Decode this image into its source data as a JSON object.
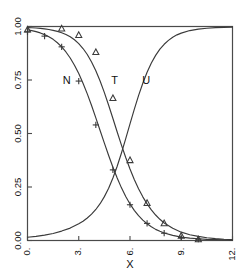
{
  "chart_data": {
    "type": "line",
    "title": "",
    "xlabel": "X",
    "ylabel": "",
    "xlim": [
      0,
      12
    ],
    "ylim": [
      0.0,
      1.0
    ],
    "grid": false,
    "legend": "inline-curve-labels",
    "xticks": [
      0,
      3,
      6,
      9,
      12
    ],
    "xtick_labels": [
      "0.",
      "3.",
      "6.",
      "9.",
      "12."
    ],
    "yticks": [
      0.0,
      0.25,
      0.5,
      0.75,
      1.0
    ],
    "ytick_labels": [
      "0.00",
      "0.25",
      "0.50",
      "0.75",
      "1.00"
    ],
    "series": [
      {
        "name": "N",
        "label": "N",
        "marker": "plus",
        "label_x": 2.3,
        "label_y": 0.745,
        "line": {
          "x": [
            0.0,
            0.25,
            0.5,
            0.75,
            1.0,
            1.25,
            1.5,
            1.75,
            2.0,
            2.25,
            2.5,
            2.75,
            3.0,
            3.25,
            3.5,
            3.75,
            4.0,
            4.25,
            4.5,
            4.75,
            5.0,
            5.25,
            5.5,
            5.75,
            6.0,
            6.25,
            6.5,
            6.75,
            7.0,
            7.25,
            7.5,
            7.75,
            8.0,
            8.5,
            9.0,
            9.5,
            10.0,
            10.5,
            11.0,
            11.5,
            12.0
          ],
          "y": [
            0.985,
            0.981,
            0.976,
            0.97,
            0.962,
            0.952,
            0.94,
            0.924,
            0.905,
            0.881,
            0.853,
            0.819,
            0.78,
            0.735,
            0.685,
            0.631,
            0.573,
            0.514,
            0.455,
            0.397,
            0.342,
            0.292,
            0.246,
            0.206,
            0.171,
            0.141,
            0.116,
            0.095,
            0.078,
            0.064,
            0.052,
            0.043,
            0.035,
            0.024,
            0.016,
            0.011,
            0.008,
            0.005,
            0.004,
            0.003,
            0.002
          ]
        },
        "points": {
          "x": [
            0.0,
            1.0,
            2.0,
            3.0,
            4.0,
            5.0,
            6.0,
            7.0,
            8.0,
            9.0,
            10.0
          ],
          "y": [
            0.975,
            0.955,
            0.905,
            0.745,
            0.54,
            0.33,
            0.167,
            0.08,
            0.034,
            0.014,
            0.006
          ]
        }
      },
      {
        "name": "T",
        "label": "T",
        "marker": "triangle",
        "label_x": 5.1,
        "label_y": 0.745,
        "line": {
          "x": [
            0.0,
            0.25,
            0.5,
            0.75,
            1.0,
            1.25,
            1.5,
            1.75,
            2.0,
            2.25,
            2.5,
            2.75,
            3.0,
            3.25,
            3.5,
            3.75,
            4.0,
            4.25,
            4.5,
            4.75,
            5.0,
            5.25,
            5.5,
            5.75,
            6.0,
            6.25,
            6.5,
            6.75,
            7.0,
            7.25,
            7.5,
            7.75,
            8.0,
            8.5,
            9.0,
            9.5,
            10.0,
            10.5,
            11.0,
            11.5,
            12.0
          ],
          "y": [
            0.995,
            0.994,
            0.993,
            0.991,
            0.989,
            0.986,
            0.982,
            0.977,
            0.971,
            0.963,
            0.952,
            0.938,
            0.92,
            0.897,
            0.869,
            0.834,
            0.793,
            0.745,
            0.691,
            0.632,
            0.57,
            0.507,
            0.446,
            0.388,
            0.334,
            0.285,
            0.242,
            0.204,
            0.171,
            0.143,
            0.119,
            0.099,
            0.082,
            0.057,
            0.039,
            0.027,
            0.019,
            0.013,
            0.009,
            0.006,
            0.004
          ]
        },
        "points": {
          "x": [
            0.0,
            2.0,
            3.0,
            4.0,
            5.0,
            6.0,
            7.0,
            8.0,
            9.0,
            10.0
          ],
          "y": [
            0.985,
            0.99,
            0.96,
            0.88,
            0.665,
            0.375,
            0.175,
            0.08,
            0.022,
            0.005
          ]
        }
      },
      {
        "name": "U",
        "label": "U",
        "marker": "none",
        "label_x": 6.95,
        "label_y": 0.745,
        "line": {
          "x": [
            0.0,
            0.5,
            1.0,
            1.5,
            2.0,
            2.5,
            3.0,
            3.25,
            3.5,
            3.75,
            4.0,
            4.25,
            4.5,
            4.75,
            5.0,
            5.25,
            5.5,
            5.75,
            6.0,
            6.25,
            6.5,
            6.75,
            7.0,
            7.25,
            7.5,
            7.75,
            8.0,
            8.25,
            8.5,
            8.75,
            9.0,
            9.5,
            10.0,
            10.5,
            11.0,
            11.5,
            12.0
          ],
          "y": [
            0.015,
            0.019,
            0.025,
            0.033,
            0.044,
            0.058,
            0.078,
            0.09,
            0.105,
            0.123,
            0.145,
            0.172,
            0.205,
            0.244,
            0.292,
            0.347,
            0.409,
            0.476,
            0.545,
            0.613,
            0.677,
            0.735,
            0.786,
            0.829,
            0.865,
            0.894,
            0.917,
            0.935,
            0.95,
            0.961,
            0.969,
            0.981,
            0.988,
            0.992,
            0.995,
            0.996,
            0.997
          ]
        },
        "points": {
          "x": [],
          "y": []
        }
      }
    ]
  },
  "colors": {
    "axis": "#4a4a4a",
    "curve": "#3a3a3a",
    "text": "#111111",
    "background": "#ffffff"
  }
}
